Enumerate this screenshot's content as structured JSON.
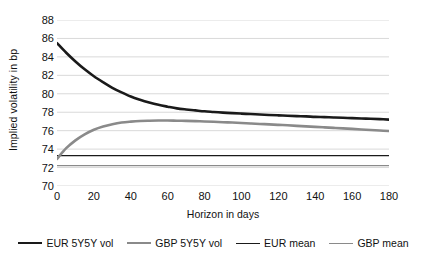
{
  "chart_data": {
    "type": "line",
    "title": "",
    "xlabel": "Horizon in days",
    "ylabel": "Implied volatility in bp",
    "xlim": [
      0,
      180
    ],
    "ylim": [
      70,
      88
    ],
    "xticks": [
      0,
      20,
      40,
      60,
      80,
      100,
      120,
      140,
      160,
      180
    ],
    "yticks": [
      70,
      72,
      74,
      76,
      78,
      80,
      82,
      84,
      86,
      88
    ],
    "grid": "horizontal",
    "legend_position": "bottom",
    "x": [
      0,
      5,
      10,
      15,
      20,
      25,
      30,
      35,
      40,
      45,
      50,
      55,
      60,
      65,
      70,
      75,
      80,
      85,
      90,
      95,
      100,
      105,
      110,
      115,
      120,
      125,
      130,
      135,
      140,
      145,
      150,
      155,
      160,
      165,
      170,
      175,
      180
    ],
    "series": [
      {
        "name": "EUR 5Y5Y vol",
        "color": "#1a1a1a",
        "width": 2.6,
        "values": [
          85.5,
          84.45,
          83.5,
          82.65,
          81.9,
          81.25,
          80.65,
          80.15,
          79.7,
          79.35,
          79.05,
          78.8,
          78.6,
          78.42,
          78.3,
          78.2,
          78.1,
          78.03,
          77.96,
          77.9,
          77.85,
          77.8,
          77.75,
          77.7,
          77.66,
          77.62,
          77.58,
          77.55,
          77.5,
          77.47,
          77.43,
          77.4,
          77.36,
          77.32,
          77.29,
          77.25,
          77.2
        ]
      },
      {
        "name": "GBP 5Y5Y vol",
        "color": "#8a8a8a",
        "width": 2.6,
        "values": [
          72.95,
          74.1,
          74.95,
          75.6,
          76.1,
          76.45,
          76.7,
          76.88,
          76.98,
          77.05,
          77.08,
          77.1,
          77.1,
          77.08,
          77.06,
          77.03,
          77.0,
          76.96,
          76.92,
          76.88,
          76.83,
          76.78,
          76.73,
          76.68,
          76.63,
          76.58,
          76.52,
          76.47,
          76.41,
          76.36,
          76.3,
          76.25,
          76.19,
          76.13,
          76.08,
          76.02,
          75.96
        ]
      },
      {
        "name": "EUR mean",
        "color": "#1a1a1a",
        "width": 1.2,
        "values": [
          73.3,
          73.3,
          73.3,
          73.3,
          73.3,
          73.3,
          73.3,
          73.3,
          73.3,
          73.3,
          73.3,
          73.3,
          73.3,
          73.3,
          73.3,
          73.3,
          73.3,
          73.3,
          73.3,
          73.3,
          73.3,
          73.3,
          73.3,
          73.3,
          73.3,
          73.3,
          73.3,
          73.3,
          73.3,
          73.3,
          73.3,
          73.3,
          73.3,
          73.3,
          73.3,
          73.3,
          73.3
        ]
      },
      {
        "name": "GBP mean",
        "color": "#8a8a8a",
        "width": 1.2,
        "values": [
          72.2,
          72.2,
          72.2,
          72.2,
          72.2,
          72.2,
          72.2,
          72.2,
          72.2,
          72.2,
          72.2,
          72.2,
          72.2,
          72.2,
          72.2,
          72.2,
          72.2,
          72.2,
          72.2,
          72.2,
          72.2,
          72.2,
          72.2,
          72.2,
          72.2,
          72.2,
          72.2,
          72.2,
          72.2,
          72.2,
          72.2,
          72.2,
          72.2,
          72.2,
          72.2,
          72.2,
          72.2
        ]
      }
    ]
  },
  "colors": {
    "grid": "#d9d9d9",
    "text": "#111111",
    "background": "#ffffff",
    "eur": "#1a1a1a",
    "gbp": "#8a8a8a"
  }
}
